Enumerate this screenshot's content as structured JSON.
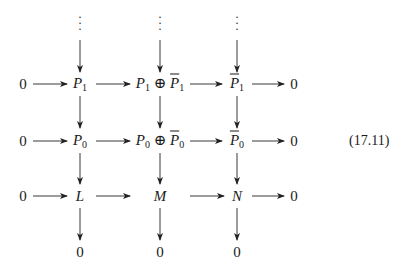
{
  "diagram": {
    "type": "commutative-diagram",
    "equation_number": "(17.11)",
    "columns": [
      "zero-left",
      "P",
      "P_plus_Pbar",
      "Pbar",
      "zero-right"
    ],
    "rows": [
      {
        "left": "0",
        "c1": {
          "base": "P",
          "sub": "1"
        },
        "c2": {
          "base": "P",
          "sub": "1",
          "op": "⊕",
          "base2": "P",
          "sub2": "1"
        },
        "c3": {
          "base": "P",
          "sub": "1",
          "bar": true
        },
        "right": "0"
      },
      {
        "left": "0",
        "c1": {
          "base": "P",
          "sub": "0"
        },
        "c2": {
          "base": "P",
          "sub": "0",
          "op": "⊕",
          "base2": "P",
          "sub2": "0"
        },
        "c3": {
          "base": "P",
          "sub": "0",
          "bar": true
        },
        "right": "0"
      },
      {
        "left": "0",
        "c1": {
          "base": "L"
        },
        "c2": {
          "base": "M"
        },
        "c3": {
          "base": "N"
        },
        "right": "0"
      }
    ],
    "bottom": [
      "0",
      "0",
      "0"
    ],
    "top_dots": "⋮",
    "arrows": [
      "0→P1",
      "P1→P1⊕P̄1",
      "P1⊕P̄1→P̄1",
      "P̄1→0",
      "0→P0",
      "P0→P0⊕P̄0",
      "P0⊕P̄0→P̄0",
      "P̄0→0",
      "0→L",
      "L→M",
      "M→N",
      "N→0",
      "⋮→P1",
      "⋮→P1⊕P̄1",
      "⋮→P̄1",
      "P1→P0",
      "P1⊕P̄1→P0⊕P̄0",
      "P̄1→P̄0",
      "P0→L",
      "P0⊕P̄0→M",
      "P̄0→N",
      "L→0",
      "M→0",
      "N→0"
    ]
  }
}
